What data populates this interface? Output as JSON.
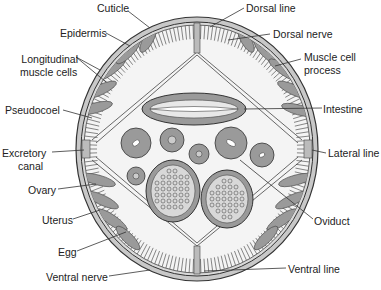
{
  "diagram": {
    "colors": {
      "line": "#333333",
      "fill_gray": "#9a9a9a",
      "light_gray": "#c8c8c8",
      "background": "#ffffff"
    },
    "labels_left": {
      "cuticle": "Cuticle",
      "epidermis": "Epidermis",
      "longitudinal_muscle_cells_1": "Longitudinal",
      "longitudinal_muscle_cells_2": "muscle cells",
      "pseudocoel": "Pseudocoel",
      "excretory_canal_1": "Excretory",
      "excretory_canal_2": "canal",
      "ovary": "Ovary",
      "uterus": "Uterus",
      "egg": "Egg",
      "ventral_nerve": "Ventral nerve"
    },
    "labels_right": {
      "dorsal_line": "Dorsal line",
      "dorsal_nerve": "Dorsal nerve",
      "muscle_cell_process_1": "Muscle cell",
      "muscle_cell_process_2": "process",
      "intestine": "Intestine",
      "lateral_line": "Lateral line",
      "oviduct": "Oviduct",
      "ventral_line": "Ventral line"
    }
  }
}
